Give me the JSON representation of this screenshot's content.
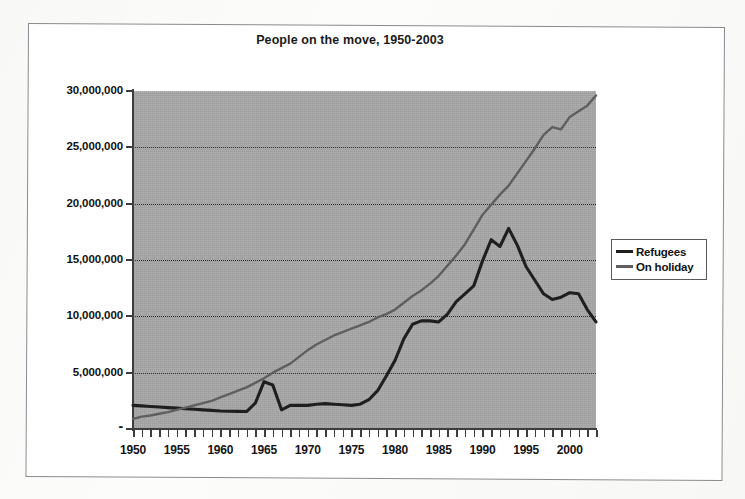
{
  "chart_data": {
    "type": "line",
    "title": "People on the move, 1950-2003",
    "xlabel": "",
    "ylabel": "",
    "xlim": [
      1950,
      2003
    ],
    "ylim": [
      0,
      30000000
    ],
    "grid": true,
    "grid_style": "dotted-horizontal",
    "legend_position": "right",
    "plot_background": "#a8a8a8",
    "x_tick_labels": [
      "1950",
      "1955",
      "1960",
      "1965",
      "1970",
      "1975",
      "1980",
      "1985",
      "1990",
      "1995",
      "2000"
    ],
    "x_ticks": [
      1950,
      1955,
      1960,
      1965,
      1970,
      1975,
      1980,
      1985,
      1990,
      1995,
      2000
    ],
    "y_tick_labels": [
      "30,000,000",
      "25,000,000",
      "20,000,000",
      "15,000,000",
      "10,000,000",
      "5,000,000",
      "-"
    ],
    "y_ticks": [
      30000000,
      25000000,
      20000000,
      15000000,
      10000000,
      5000000,
      0
    ],
    "x": [
      1950,
      1951,
      1952,
      1953,
      1954,
      1955,
      1956,
      1957,
      1958,
      1959,
      1960,
      1961,
      1962,
      1963,
      1964,
      1965,
      1966,
      1967,
      1968,
      1969,
      1970,
      1971,
      1972,
      1973,
      1974,
      1975,
      1976,
      1977,
      1978,
      1979,
      1980,
      1981,
      1982,
      1983,
      1984,
      1985,
      1986,
      1987,
      1988,
      1989,
      1990,
      1991,
      1992,
      1993,
      1994,
      1995,
      1996,
      1997,
      1998,
      1999,
      2000,
      2001,
      2002,
      2003
    ],
    "series": [
      {
        "name": "Refugees",
        "color": "#1f1f1f",
        "values": [
          2100000,
          2050000,
          2000000,
          1950000,
          1900000,
          1850000,
          1800000,
          1750000,
          1700000,
          1650000,
          1600000,
          1580000,
          1560000,
          1550000,
          2300000,
          4200000,
          3900000,
          1700000,
          2100000,
          2100000,
          2100000,
          2200000,
          2250000,
          2200000,
          2150000,
          2100000,
          2200000,
          2600000,
          3400000,
          4700000,
          6100000,
          8000000,
          9300000,
          9600000,
          9600000,
          9500000,
          10200000,
          11300000,
          12000000,
          12700000,
          14900000,
          16800000,
          16200000,
          17800000,
          16300000,
          14400000,
          13200000,
          12000000,
          11500000,
          11700000,
          12100000,
          12000000,
          10600000,
          9500000
        ]
      },
      {
        "name": "On holiday",
        "color": "#5f5f5f",
        "values": [
          900000,
          1100000,
          1200000,
          1350000,
          1500000,
          1700000,
          1900000,
          2100000,
          2300000,
          2500000,
          2800000,
          3100000,
          3400000,
          3700000,
          4100000,
          4500000,
          5000000,
          5400000,
          5800000,
          6400000,
          7000000,
          7500000,
          7900000,
          8300000,
          8600000,
          8900000,
          9200000,
          9500000,
          9900000,
          10200000,
          10600000,
          11200000,
          11800000,
          12300000,
          12900000,
          13600000,
          14500000,
          15400000,
          16400000,
          17700000,
          19000000,
          19900000,
          20800000,
          21600000,
          22700000,
          23800000,
          24900000,
          26100000,
          26800000,
          26600000,
          27700000,
          28200000,
          28700000,
          29600000
        ]
      }
    ]
  },
  "legend": {
    "items": [
      {
        "label": "Refugees",
        "color": "#1f1f1f"
      },
      {
        "label": "On holiday",
        "color": "#5f5f5f"
      }
    ]
  }
}
